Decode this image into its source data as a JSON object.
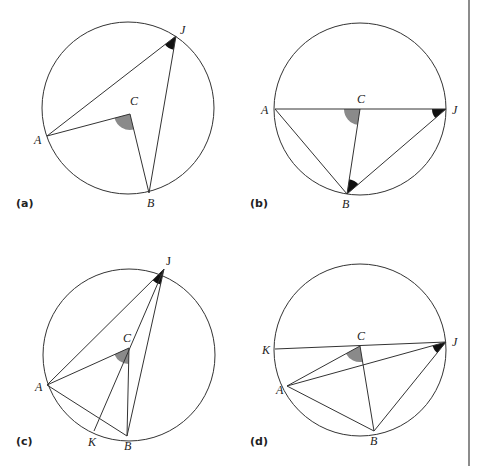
{
  "figure": {
    "width": 480,
    "height": 466,
    "divider": {
      "x": 469,
      "y1": 0,
      "y2": 466,
      "color": "#666666"
    },
    "colors": {
      "stroke": "#333333",
      "central_angle_fill": "#8a8a8a",
      "inscribed_angle_fill": "#111111"
    },
    "panels": [
      {
        "id": "a",
        "label": "(a)",
        "label_pos": [
          16,
          207
        ],
        "circle": {
          "cx": 128,
          "cy": 108,
          "r": 86
        },
        "points": {
          "J": {
            "x": 176,
            "y": 36,
            "label": "J",
            "label_dx": 4,
            "label_dy": -2,
            "upright": false
          },
          "A": {
            "x": 47,
            "y": 136,
            "label": "A",
            "label_dx": -13,
            "label_dy": 8,
            "upright": false
          },
          "C": {
            "x": 130,
            "y": 114,
            "label": "C",
            "label_dx": 0,
            "label_dy": -9,
            "upright": false
          },
          "B": {
            "x": 149,
            "y": 193,
            "label": "B",
            "label_dx": -2,
            "label_dy": 14,
            "upright": false
          }
        },
        "segments": [
          [
            "J",
            "A"
          ],
          [
            "J",
            "B"
          ],
          [
            "A",
            "C"
          ],
          [
            "C",
            "B"
          ]
        ],
        "central_angle": {
          "vertex": "C",
          "from": "A",
          "to": "B",
          "r": 16
        },
        "inscribed_angles": [
          {
            "vertex": "J",
            "from": "A",
            "to": "B",
            "r": 14
          }
        ]
      },
      {
        "id": "b",
        "label": "(b)",
        "label_pos": [
          250,
          207
        ],
        "circle": {
          "cx": 360,
          "cy": 109,
          "r": 86
        },
        "points": {
          "A": {
            "x": 275,
            "y": 109,
            "label": "A",
            "label_dx": -14,
            "label_dy": 5,
            "upright": false
          },
          "J": {
            "x": 446,
            "y": 109,
            "label": "J",
            "label_dx": 6,
            "label_dy": 5,
            "upright": false
          },
          "C": {
            "x": 360,
            "y": 109,
            "label": "C",
            "label_dx": -3,
            "label_dy": -6,
            "upright": false
          },
          "B": {
            "x": 347,
            "y": 194,
            "label": "B",
            "label_dx": -5,
            "label_dy": 14,
            "upright": false
          }
        },
        "segments": [
          [
            "A",
            "J"
          ],
          [
            "A",
            "B"
          ],
          [
            "C",
            "B"
          ],
          [
            "B",
            "J"
          ]
        ],
        "central_angle": {
          "vertex": "C",
          "from": "A",
          "to": "B",
          "r": 16
        },
        "inscribed_angles": [
          {
            "vertex": "J",
            "from": "A",
            "to": "B",
            "r": 14
          },
          {
            "vertex": "B",
            "from": "C",
            "to": "J",
            "r": 15
          }
        ]
      },
      {
        "id": "c",
        "label": "(c)",
        "label_pos": [
          16,
          445
        ],
        "circle": {
          "cx": 129,
          "cy": 355,
          "r": 86
        },
        "points": {
          "J": {
            "x": 164,
            "y": 269,
            "label": "J",
            "label_dx": 2,
            "label_dy": -4,
            "upright": true
          },
          "A": {
            "x": 47,
            "y": 385,
            "label": "A",
            "label_dx": -12,
            "label_dy": 6,
            "upright": false
          },
          "C": {
            "x": 129,
            "y": 348,
            "label": "C",
            "label_dx": -6,
            "label_dy": -6,
            "upright": false
          },
          "K": {
            "x": 94,
            "y": 431,
            "label": "K",
            "label_dx": -6,
            "label_dy": 15,
            "upright": false
          },
          "B": {
            "x": 127,
            "y": 436,
            "label": "B",
            "label_dx": -3,
            "label_dy": 14,
            "upright": false
          }
        },
        "segments": [
          [
            "J",
            "A"
          ],
          [
            "J",
            "B"
          ],
          [
            "J",
            "K"
          ],
          [
            "A",
            "C"
          ],
          [
            "C",
            "B"
          ],
          [
            "A",
            "B"
          ]
        ],
        "central_angle": {
          "vertex": "C",
          "from": "A",
          "to": "B",
          "r": 16
        },
        "inscribed_angles": [
          {
            "vertex": "J",
            "from": "A",
            "to": "B",
            "r": 16
          }
        ]
      },
      {
        "id": "d",
        "label": "(d)",
        "label_pos": [
          250,
          445
        ],
        "circle": {
          "cx": 360,
          "cy": 350,
          "r": 86
        },
        "points": {
          "K": {
            "x": 275,
            "y": 349,
            "label": "K",
            "label_dx": -13,
            "label_dy": 5,
            "upright": false
          },
          "J": {
            "x": 446,
            "y": 342,
            "label": "J",
            "label_dx": 6,
            "label_dy": 4,
            "upright": false
          },
          "C": {
            "x": 360,
            "y": 346,
            "label": "C",
            "label_dx": -3,
            "label_dy": -6,
            "upright": false
          },
          "A": {
            "x": 287,
            "y": 386,
            "label": "A",
            "label_dx": -11,
            "label_dy": 8,
            "upright": false
          },
          "B": {
            "x": 374,
            "y": 431,
            "label": "B",
            "label_dx": -4,
            "label_dy": 14,
            "upright": false
          }
        },
        "segments": [
          [
            "K",
            "J"
          ],
          [
            "A",
            "C"
          ],
          [
            "C",
            "B"
          ],
          [
            "A",
            "J"
          ],
          [
            "A",
            "B"
          ],
          [
            "B",
            "J"
          ]
        ],
        "central_angle": {
          "vertex": "C",
          "from": "A",
          "to": "B",
          "r": 16
        },
        "inscribed_angles": [
          {
            "vertex": "J",
            "from": "A",
            "to": "B",
            "r": 14
          }
        ]
      }
    ]
  }
}
